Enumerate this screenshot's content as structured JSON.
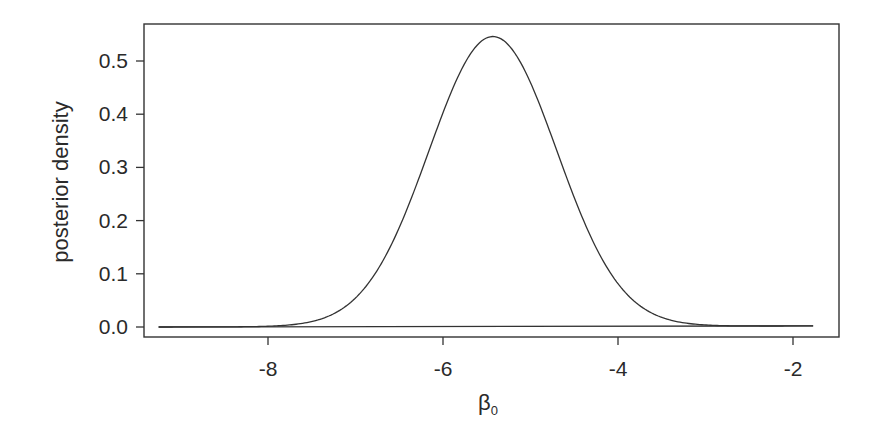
{
  "chart_data": {
    "type": "line",
    "title": "",
    "xlabel": "β",
    "xlabel_subscript": "0",
    "ylabel": "posterior density",
    "xlim": [
      -9.3,
      -1.5
    ],
    "ylim": [
      -0.022,
      0.57
    ],
    "xticks": [
      -8,
      -6,
      -4,
      -2
    ],
    "xtick_labels": [
      "-8",
      "-6",
      "-4",
      "-2"
    ],
    "yticks": [
      0.0,
      0.1,
      0.2,
      0.3,
      0.4,
      0.5
    ],
    "ytick_labels": [
      "0.0",
      "0.1",
      "0.2",
      "0.3",
      "0.4",
      "0.5"
    ],
    "grid": false,
    "legend": null,
    "series": [
      {
        "name": "posterior density",
        "shape": "approximately normal",
        "mode_x": -5.43,
        "peak_y": 0.545,
        "sd_estimate": 0.73,
        "x": [
          -9.25,
          -8.5,
          -8.0,
          -7.5,
          -7.0,
          -6.5,
          -6.0,
          -5.75,
          -5.43,
          -5.0,
          -4.75,
          -4.5,
          -4.0,
          -3.5,
          -3.0,
          -2.5,
          -2.0,
          -1.77
        ],
        "y": [
          0.0,
          0.002,
          0.006,
          0.022,
          0.054,
          0.19,
          0.383,
          0.492,
          0.545,
          0.46,
          0.346,
          0.262,
          0.079,
          0.016,
          0.004,
          0.002,
          0.002,
          0.002
        ]
      },
      {
        "name": "baseline",
        "x": [
          -9.25,
          -1.77
        ],
        "y": [
          0.0,
          0.002
        ]
      }
    ]
  }
}
